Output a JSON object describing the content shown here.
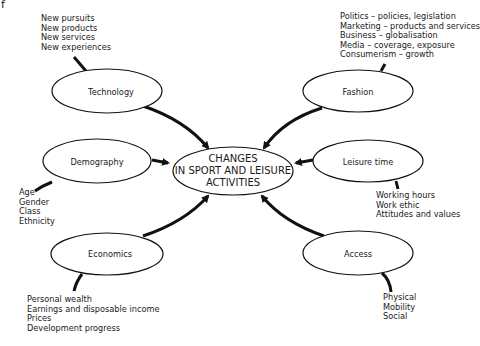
{
  "corner_mark": "f",
  "center": {
    "lines": [
      "CHANGES",
      "IN SPORT AND LEISURE",
      "ACTIVITIES"
    ]
  },
  "nodes": [
    {
      "id": "technology",
      "label": "Technology",
      "factors": [
        "New pursuits",
        "New products",
        "New services",
        "New experiences"
      ]
    },
    {
      "id": "fashion",
      "label": "Fashion",
      "factors": [
        "Politics – policies, legislation",
        "Marketing – products and services",
        "Business – globalisation",
        "Media – coverage, exposure",
        "Consumerism – growth"
      ]
    },
    {
      "id": "demography",
      "label": "Demography",
      "factors": [
        "Age",
        "Gender",
        "Class",
        "Ethnicity"
      ]
    },
    {
      "id": "leisure-time",
      "label": "Leisure time",
      "factors": [
        "Working hours",
        "Work ethic",
        "Attitudes and values"
      ]
    },
    {
      "id": "economics",
      "label": "Economics",
      "factors": [
        "Personal wealth",
        "Earnings and disposable income",
        "Prices",
        "Development progress"
      ]
    },
    {
      "id": "access",
      "label": "Access",
      "factors": [
        "Physical",
        "Mobility",
        "Social"
      ]
    }
  ],
  "colors": {
    "stroke": "#111111",
    "background": "#ffffff",
    "text": "#1a1a1a"
  }
}
